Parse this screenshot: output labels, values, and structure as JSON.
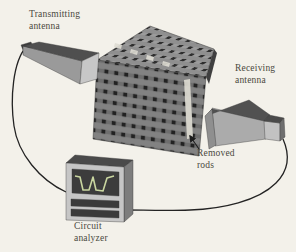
{
  "figure": {
    "type": "experimental-setup-diagram",
    "background_color": "#f3f1ea",
    "labels": {
      "transmitting_antenna": {
        "line1": "Transmitting",
        "line2": "antenna"
      },
      "receiving_antenna": {
        "line1": "Receiving",
        "line2": "antenna"
      },
      "removed_rods": {
        "line1": "Removed",
        "line2": "rods"
      },
      "circuit_analyzer": {
        "line1": "Circuit",
        "line2": "analyzer"
      }
    },
    "icons": [
      "transmitting-horn-antenna-icon",
      "receiving-horn-antenna-icon",
      "woodpile-lattice-icon",
      "removed-rod-gap-icon",
      "circuit-analyzer-box-icon",
      "transmission-spectrum-icon",
      "coax-cable-icon",
      "pointer-arrow-icon"
    ],
    "colors": {
      "label_text": "#4a4940",
      "cable": "#232323",
      "horn_top": "#4f4f4f",
      "horn_side": "#9a9a9a",
      "horn_face": "#c7c7c7",
      "lattice_rod_top": "#909090",
      "lattice_rod_front": "#828282",
      "lattice_hole": "#282828",
      "removed_rod_gap": "#d9d7ce",
      "analyzer_top": "#4a4a4a",
      "analyzer_front": "#c6c6c6",
      "analyzer_screen": "#3c3c3c",
      "spectrum_curve": "#c9d6a0"
    }
  }
}
